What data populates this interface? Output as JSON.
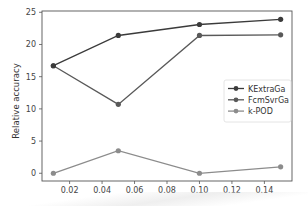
{
  "chart_data": {
    "type": "line",
    "title": "",
    "xlabel": "",
    "ylabel": "Relative accuracy",
    "xlim": [
      0.003,
      0.157
    ],
    "ylim": [
      -1.2,
      25.2
    ],
    "xticks": [
      0.02,
      0.04,
      0.06,
      0.08,
      0.1,
      0.12,
      0.14
    ],
    "xtick_labels": [
      "0.02",
      "0.04",
      "0.06",
      "0.08",
      "0.10",
      "0.12",
      "0.14"
    ],
    "yticks": [
      0,
      5,
      10,
      15,
      20,
      25
    ],
    "ytick_labels": [
      "0",
      "5",
      "10",
      "15",
      "20",
      "25"
    ],
    "grid": false,
    "legend_position": "center right",
    "x": [
      0.01,
      0.05,
      0.1,
      0.15
    ],
    "series": [
      {
        "name": "KExtraGa",
        "color": "#3b3b3b",
        "marker": "circle",
        "values": [
          16.7,
          21.4,
          23.1,
          23.9
        ]
      },
      {
        "name": "FcmSvrGa",
        "color": "#595959",
        "marker": "circle",
        "values": [
          16.7,
          10.7,
          21.4,
          21.5
        ]
      },
      {
        "name": "k-POD",
        "color": "#8c8c8c",
        "marker": "circle",
        "values": [
          0.0,
          3.5,
          0.0,
          1.0
        ]
      }
    ]
  }
}
